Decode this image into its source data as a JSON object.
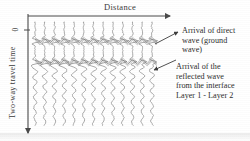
{
  "figure": {
    "title_axis_x": "Distance",
    "title_axis_y": "Two-way travel time",
    "zero_tick": "0"
  },
  "callouts": {
    "direct": {
      "line1": "Arrival of direct",
      "line2": "wave (ground",
      "line3": "wave)"
    },
    "reflected": {
      "line1": "Arrival of the",
      "line2": "reflected wave",
      "line3": "from the interface",
      "line4": "Layer 1 - Layer 2"
    }
  },
  "colors": {
    "ink": "#3a3a3a",
    "trace": "#8c8c8c",
    "band": "#6f6f6f",
    "background": "#ffffff"
  },
  "chart_data": {
    "type": "line",
    "title": "",
    "xlabel": "Distance",
    "ylabel": "Two-way travel time",
    "grid": false,
    "legend": "none",
    "trace_count": 13,
    "trace_x_start": 35,
    "trace_x_step": 9.75,
    "trace_top": 22,
    "trace_bottom": 126,
    "events": [
      {
        "name": "direct-ground-wave",
        "time_y": 41,
        "amplitude": 6
      },
      {
        "name": "reflected-wave-layer1-layer2",
        "time_y": 62,
        "amplitude": 5
      }
    ],
    "axis_x_range": [
      28,
      172
    ],
    "axis_y_range": [
      16,
      135
    ]
  }
}
